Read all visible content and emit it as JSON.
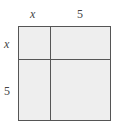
{
  "diagram": {
    "title": "",
    "top_labels": [
      "x",
      "5"
    ],
    "side_labels": [
      "x",
      "5"
    ],
    "cells": [
      {
        "row": 0,
        "col": 0,
        "label": ""
      },
      {
        "row": 0,
        "col": 1,
        "label": ""
      },
      {
        "row": 1,
        "col": 0,
        "label": ""
      },
      {
        "row": 1,
        "col": 1,
        "label": ""
      }
    ],
    "fill_color": "#eeeeee",
    "line_color": "#555555"
  }
}
